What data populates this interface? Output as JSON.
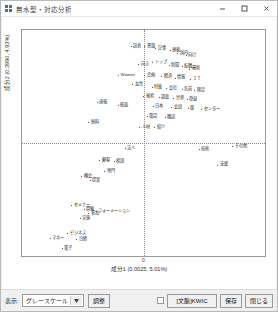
{
  "window": {
    "title": "無水型・対応分析",
    "icon": "app-grid-icon",
    "minimize_label": "—",
    "maximize_label": "□",
    "close_label": "✕"
  },
  "chart_data": {
    "type": "scatter",
    "title": "",
    "xlabel": "成分1 (0.0025, 5.01%)",
    "ylabel": "成分2 (0.3996, 4.93%)",
    "xlim": [
      -1.0,
      1.0
    ],
    "ylim": [
      -1.0,
      1.0
    ],
    "grid": false,
    "legend": "none",
    "origin_tick_label": "0",
    "crosshair": {
      "x": 0,
      "y": 0,
      "style": "dotted"
    },
    "points": [
      {
        "label": "読者",
        "x": -0.05,
        "y": 0.86
      },
      {
        "label": "書籍",
        "x": 0.06,
        "y": 0.86
      },
      {
        "label": "記事",
        "x": 0.15,
        "y": 0.84
      },
      {
        "label": "連載",
        "x": 0.27,
        "y": 0.82
      },
      {
        "label": "国内",
        "x": 0.33,
        "y": 0.8
      },
      {
        "label": "向け",
        "x": 0.4,
        "y": 0.78
      },
      {
        "label": "トップ",
        "x": 0.14,
        "y": 0.72
      },
      {
        "label": "向き",
        "x": 0.01,
        "y": 0.7
      },
      {
        "label": "新聞",
        "x": 0.26,
        "y": 0.69
      },
      {
        "label": "転職",
        "x": 0.37,
        "y": 0.68
      },
      {
        "label": "最新",
        "x": 0.43,
        "y": 0.66
      },
      {
        "label": "Women",
        "x": -0.13,
        "y": 0.6
      },
      {
        "label": "企画",
        "x": 0.06,
        "y": 0.6
      },
      {
        "label": "経済",
        "x": 0.2,
        "y": 0.59
      },
      {
        "label": "情報",
        "x": 0.31,
        "y": 0.58
      },
      {
        "label": "ＩＴ",
        "x": 0.44,
        "y": 0.57
      },
      {
        "label": "女性",
        "x": -0.04,
        "y": 0.52
      },
      {
        "label": "特集",
        "x": 0.12,
        "y": 0.5
      },
      {
        "label": "会社",
        "x": 0.24,
        "y": 0.49
      },
      {
        "label": "名前",
        "x": 0.37,
        "y": 0.48
      },
      {
        "label": "限定",
        "x": 0.47,
        "y": 0.47
      },
      {
        "label": "検索",
        "x": 0.05,
        "y": 0.42
      },
      {
        "label": "調査",
        "x": 0.18,
        "y": 0.41
      },
      {
        "label": "世界",
        "x": 0.3,
        "y": 0.4
      },
      {
        "label": "登録",
        "x": 0.41,
        "y": 0.39
      },
      {
        "label": "速報",
        "x": -0.33,
        "y": 0.36
      },
      {
        "label": "紙面",
        "x": -0.16,
        "y": 0.34
      },
      {
        "label": "日本",
        "x": 0.13,
        "y": 0.33
      },
      {
        "label": "会員",
        "x": 0.28,
        "y": 0.32
      },
      {
        "label": "版",
        "x": 0.4,
        "y": 0.31
      },
      {
        "label": "センター",
        "x": 0.56,
        "y": 0.3
      },
      {
        "label": "電話",
        "x": 0.08,
        "y": 0.24
      },
      {
        "label": "購読",
        "x": 0.23,
        "y": 0.23
      },
      {
        "label": "無料",
        "x": -0.4,
        "y": 0.19
      },
      {
        "label": "人材",
        "x": 0.02,
        "y": 0.14
      },
      {
        "label": "紹介",
        "x": 0.14,
        "y": 0.14
      },
      {
        "label": "法人",
        "x": -0.1,
        "y": -0.04
      },
      {
        "label": "技術",
        "x": 0.51,
        "y": -0.05
      },
      {
        "label": "その他",
        "x": 0.8,
        "y": -0.03
      },
      {
        "label": "顧客",
        "x": -0.31,
        "y": -0.15
      },
      {
        "label": "相談",
        "x": -0.19,
        "y": -0.16
      },
      {
        "label": "支援",
        "x": 0.66,
        "y": -0.19
      },
      {
        "label": "専門",
        "x": -0.27,
        "y": -0.25
      },
      {
        "label": "機会",
        "x": -0.46,
        "y": -0.29
      },
      {
        "label": "提案",
        "x": -0.39,
        "y": -0.33
      },
      {
        "label": "セミナー",
        "x": -0.51,
        "y": -0.55
      },
      {
        "label": "開催",
        "x": -0.44,
        "y": -0.58
      },
      {
        "label": "参加",
        "x": -0.4,
        "y": -0.62
      },
      {
        "label": "フォーメーション",
        "x": -0.24,
        "y": -0.6
      },
      {
        "label": "実施",
        "x": -0.47,
        "y": -0.66
      },
      {
        "label": "ビジネス",
        "x": -0.54,
        "y": -0.8
      },
      {
        "label": "マネー",
        "x": -0.7,
        "y": -0.84
      },
      {
        "label": "日経",
        "x": -0.5,
        "y": -0.85
      },
      {
        "label": "電子",
        "x": -0.62,
        "y": -0.93
      }
    ]
  },
  "toolbar": {
    "display_label": "表示:",
    "colormap_value": "グレースケール",
    "colormap_arrow": "▾",
    "adjust_label": "調整",
    "kwic_checkbox_checked": false,
    "kwic_label": "[文脈]KWIC",
    "save_label": "保存",
    "close_label": "閉じる"
  }
}
